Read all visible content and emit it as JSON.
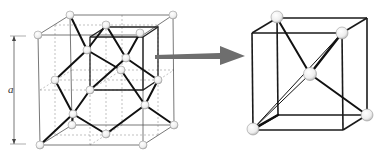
{
  "figure": {
    "dimension_label": "a",
    "colors": {
      "background": "#ffffff",
      "edge": "#222222",
      "thin_edge": "#666666",
      "dashed_edge": "#888888",
      "bond": "#111111",
      "arrow": "#6e6e6e",
      "atom_fill": "#f2f2f2",
      "atom_stroke": "#9a9a9a"
    },
    "left_panel": {
      "name": "diamond-unit-cell",
      "atom_count_visible": 18
    },
    "arrow": {
      "name": "zoom-arrow",
      "direction": "right"
    },
    "right_panel": {
      "name": "tetrahedral-subcell",
      "atom_count_visible": 5
    }
  }
}
